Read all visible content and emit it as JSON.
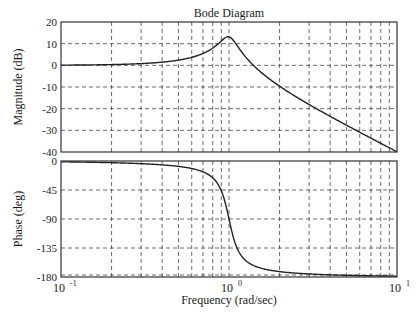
{
  "chart_data": [
    {
      "type": "line",
      "panel": "magnitude",
      "title": "Bode Diagram",
      "xlabel": "Frequency (rad/sec)",
      "ylabel": "Magnitude (dB)",
      "xscale": "log",
      "xlim": [
        0.1,
        10
      ],
      "ylim": [
        -40,
        20
      ],
      "yticks": [
        20,
        10,
        0,
        -10,
        -20,
        -30,
        -40
      ],
      "xtick_labels": [
        "10^-1",
        "10^0",
        "10^1"
      ],
      "grid": true,
      "series": [
        {
          "name": "Magnitude",
          "x": [
            0.1,
            0.2,
            0.3,
            0.5,
            0.7,
            0.8,
            0.9,
            0.95,
            1.0,
            1.1,
            1.2,
            1.5,
            2,
            3,
            5,
            7,
            10
          ],
          "values": [
            0.09,
            0.35,
            0.8,
            2.4,
            5.5,
            7.9,
            11.1,
            12.9,
            13.2,
            9.6,
            5.9,
            -1.8,
            -9.6,
            -18.1,
            -27.9,
            -33.8,
            -40
          ]
        }
      ],
      "model": {
        "wn": 1.0,
        "zeta": 0.11
      }
    },
    {
      "type": "line",
      "panel": "phase",
      "xlabel": "Frequency (rad/sec)",
      "ylabel": "Phase (deg)",
      "xscale": "log",
      "xlim": [
        0.1,
        10
      ],
      "ylim": [
        -180,
        0
      ],
      "yticks": [
        0,
        -45,
        -90,
        -135,
        -180
      ],
      "xtick_labels": [
        "10^-1",
        "10^0",
        "10^1"
      ],
      "grid": true,
      "series": [
        {
          "name": "Phase",
          "x": [
            0.1,
            0.2,
            0.3,
            0.5,
            0.7,
            0.8,
            0.9,
            0.95,
            1.0,
            1.05,
            1.1,
            1.2,
            1.5,
            2,
            3,
            5,
            10
          ],
          "values": [
            -1.3,
            -2.6,
            -4.1,
            -8.3,
            -15.0,
            -21.5,
            -34.7,
            -53.4,
            -90,
            -125.7,
            -144.4,
            -160.4,
            -172.1,
            -175.8,
            -177.5,
            -178.7,
            -178.7
          ]
        }
      ]
    }
  ],
  "labels": {
    "title": "Bode Diagram",
    "xlabel": "Frequency (rad/sec)",
    "mag_ylabel": "Magnitude (dB)",
    "phase_ylabel": "Phase (deg)",
    "mag_yticks": [
      "20",
      "10",
      "0",
      "-10",
      "-20",
      "-30",
      "-40"
    ],
    "phase_yticks": [
      "0",
      "-45",
      "-90",
      "-135",
      "-180"
    ],
    "x_base": "10",
    "x_exps": [
      "-1",
      "0",
      "1"
    ]
  }
}
